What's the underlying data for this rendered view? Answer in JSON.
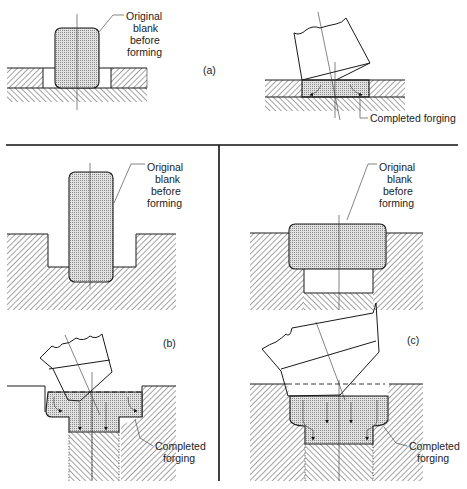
{
  "figure": {
    "panels": [
      {
        "id": "a",
        "label": "(a)",
        "annotations": {
          "blank": [
            "Original",
            "blank",
            "before",
            "forming"
          ],
          "forging": "Completed forging"
        }
      },
      {
        "id": "b",
        "label": "(b)",
        "annotations": {
          "blank": [
            "Original",
            "blank",
            "before",
            "forming"
          ],
          "forging": [
            "Completed",
            "forging"
          ]
        }
      },
      {
        "id": "c",
        "label": "(c)",
        "annotations": {
          "blank": [
            "Original",
            "blank",
            "before",
            "forming"
          ],
          "forging": [
            "Completed",
            "forging"
          ]
        }
      }
    ],
    "colors": {
      "line": "#1a1a1a",
      "background": "#ffffff",
      "blank_fill": "#cfcfcf"
    }
  }
}
